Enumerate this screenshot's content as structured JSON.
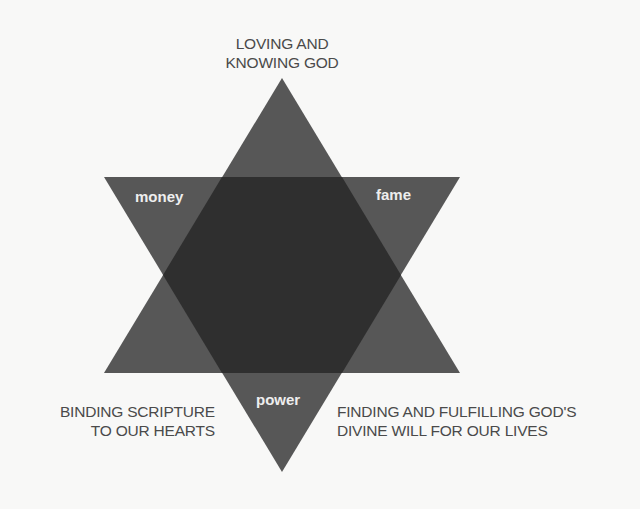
{
  "diagram": {
    "type": "hexagram",
    "colors": {
      "background": "#f8f8f7",
      "triangle_fill": "#575757",
      "overlap_fill": "#2f2f2f",
      "caption_text": "#4a4a4a",
      "inner_label_text": "#eeeeee"
    },
    "captions": {
      "top": {
        "line1": "LOVING AND",
        "line2": "KNOWING GOD"
      },
      "bottom_left": {
        "line1": "BINDING SCRIPTURE",
        "line2": "TO OUR HEARTS"
      },
      "bottom_right": {
        "line1": "FINDING AND FULFILLING GOD'S",
        "line2": "DIVINE WILL FOR OUR LIVES"
      }
    },
    "inner_labels": {
      "upper_left": "money",
      "upper_right": "fame",
      "bottom": "power"
    }
  }
}
